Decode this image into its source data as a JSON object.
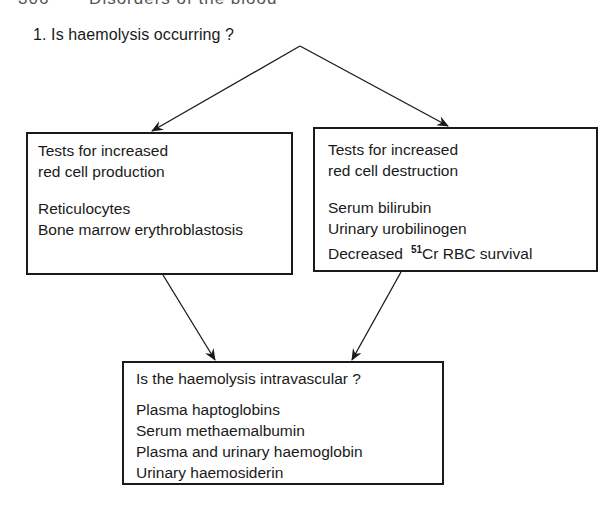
{
  "page_header": {
    "page_number": "306",
    "running_title": "Disorders of the blood"
  },
  "flowchart": {
    "question_1": "1. Is haemolysis occurring ?",
    "production_box": {
      "title_lines": [
        "Tests for increased",
        "red cell production"
      ],
      "items": [
        "Reticulocytes",
        "Bone marrow erythroblastosis"
      ]
    },
    "destruction_box": {
      "title_lines": [
        "Tests for increased",
        "red cell destruction"
      ],
      "items": [
        "Serum bilirubin",
        "Urinary urobilinogen"
      ],
      "survival_item": {
        "prefix": "Decreased",
        "isotope_mass": "51",
        "suffix": "Cr RBC survival"
      }
    },
    "intravascular_box": {
      "title": "Is the haemolysis intravascular ?",
      "items": [
        "Plasma haptoglobins",
        "Serum methaemalbumin",
        "Plasma and urinary haemoglobin",
        "Urinary haemosiderin"
      ]
    },
    "colors": {
      "ink": "#1a1a1a",
      "background": "#ffffff"
    }
  }
}
